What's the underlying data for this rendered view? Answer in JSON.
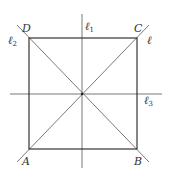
{
  "diagram": {
    "type": "geometry",
    "colors": {
      "square": "#222222",
      "axis": "#555555",
      "label": "#333333"
    },
    "square": {
      "vertices": {
        "A": {
          "label": "A",
          "x": 29,
          "y": 149
        },
        "B": {
          "label": "B",
          "x": 137,
          "y": 149
        },
        "C": {
          "label": "C",
          "x": 137,
          "y": 38
        },
        "D": {
          "label": "D",
          "x": 29,
          "y": 38
        }
      }
    },
    "center": {
      "x": 82,
      "y": 94
    },
    "lines": [
      {
        "id": "l",
        "label": "ℓ",
        "subscript": "",
        "kind": "diagonal AC",
        "x1": 17,
        "y1": 162,
        "x2": 149,
        "y2": 25
      },
      {
        "id": "l1",
        "label": "ℓ",
        "subscript": "1",
        "kind": "vertical axis",
        "x1": 82,
        "y1": 14,
        "x2": 82,
        "y2": 168
      },
      {
        "id": "l2",
        "label": "ℓ",
        "subscript": "2",
        "kind": "diagonal DB",
        "x1": 17,
        "y1": 25,
        "x2": 149,
        "y2": 162
      },
      {
        "id": "l3",
        "label": "ℓ",
        "subscript": "3",
        "kind": "horizontal axis",
        "x1": 10,
        "y1": 94,
        "x2": 162,
        "y2": 94
      }
    ]
  }
}
